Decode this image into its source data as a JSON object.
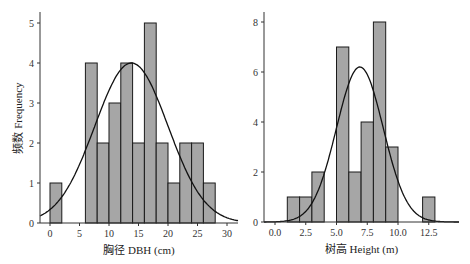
{
  "chart_data": [
    {
      "type": "bar",
      "subtype": "histogram_with_normal_curve",
      "xlabel": "胸径 DBH (cm)",
      "ylabel": "频数 Frequency",
      "bin_width": 2,
      "bins": [
        [
          0,
          2
        ],
        [
          2,
          4
        ],
        [
          4,
          6
        ],
        [
          6,
          8
        ],
        [
          8,
          10
        ],
        [
          10,
          12
        ],
        [
          12,
          14
        ],
        [
          14,
          16
        ],
        [
          16,
          18
        ],
        [
          18,
          20
        ],
        [
          20,
          22
        ],
        [
          22,
          24
        ],
        [
          24,
          26
        ],
        [
          26,
          28
        ]
      ],
      "values": [
        1,
        0,
        0,
        4,
        2,
        3,
        4,
        2,
        5,
        2,
        1,
        2,
        2,
        1
      ],
      "normal_curve": {
        "mean": 13.8,
        "sd": 6.2,
        "peak": 4.0
      },
      "xticks": [
        "0",
        "5",
        "10",
        "15",
        "20",
        "25",
        "30"
      ],
      "yticks": [
        "0",
        "1",
        "2",
        "3",
        "4",
        "5"
      ],
      "xlim": [
        -1.7,
        32
      ],
      "ylim": [
        0,
        5.3
      ],
      "grid": false
    },
    {
      "type": "bar",
      "subtype": "histogram_with_normal_curve",
      "xlabel": "树高 Height (m)",
      "ylabel": "",
      "bin_width": 1,
      "bins": [
        [
          1,
          2
        ],
        [
          2,
          3
        ],
        [
          3,
          4
        ],
        [
          4,
          5
        ],
        [
          5,
          6
        ],
        [
          6,
          7
        ],
        [
          7,
          8
        ],
        [
          8,
          9
        ],
        [
          9,
          10
        ],
        [
          10,
          11
        ],
        [
          11,
          12
        ],
        [
          12,
          13
        ]
      ],
      "values": [
        1,
        1,
        2,
        0,
        7,
        2,
        4,
        8,
        3,
        0,
        0,
        1
      ],
      "normal_curve": {
        "mean": 6.9,
        "sd": 1.9,
        "peak": 6.2
      },
      "xticks": [
        "0.0",
        "2.5",
        "5.0",
        "7.5",
        "10.0",
        "12.5"
      ],
      "yticks": [
        "0",
        "2",
        "4",
        "6",
        "8"
      ],
      "xlim": [
        -1.0,
        14.8
      ],
      "ylim": [
        0,
        8.4
      ],
      "grid": false
    }
  ],
  "colors": {
    "bar_fill": "#a6a6a6",
    "bar_stroke": "#1a1a1a",
    "curve": "#111111",
    "axis": "#333333"
  }
}
